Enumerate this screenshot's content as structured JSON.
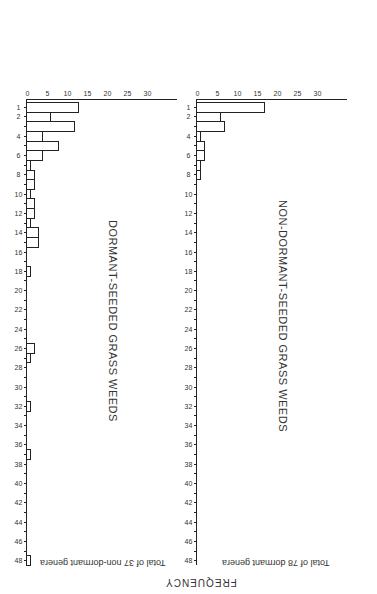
{
  "chart_data": [
    {
      "type": "bar",
      "title": "NON-DORMANT-SEEDED GRASS WEEDS",
      "ylabel": "Total of 37 non-dormant genera",
      "xlabel": "",
      "shared_ylabel": "FREQUENCY",
      "x_tick_labels": [
        "1",
        "2",
        "4",
        "6",
        "8",
        "10",
        "12",
        "14",
        "16",
        "18",
        "20",
        "22",
        "24",
        "26",
        "28",
        "30",
        "32",
        "34",
        "36",
        "38",
        "40",
        "42",
        "44",
        "46",
        "48"
      ],
      "y_tick_labels": [
        "0",
        "5",
        "10",
        "15",
        "20",
        "25",
        "30"
      ],
      "ylim": [
        0,
        35
      ],
      "xlim": [
        1,
        48
      ],
      "grid": false,
      "categories": [
        1,
        2,
        3,
        4,
        5,
        6,
        7,
        8
      ],
      "values": [
        17,
        6,
        7,
        1,
        2,
        2,
        1,
        1
      ]
    },
    {
      "type": "bar",
      "title": "DORMANT-SEEDED GRASS WEEDS",
      "ylabel": "Total of 78 dormant genera",
      "xlabel": "",
      "shared_ylabel": "FREQUENCY",
      "x_tick_labels": [
        "1",
        "2",
        "4",
        "6",
        "8",
        "10",
        "12",
        "14",
        "16",
        "18",
        "20",
        "22",
        "24",
        "26",
        "28",
        "30",
        "32",
        "34",
        "36",
        "38",
        "40",
        "42",
        "44",
        "46",
        "48"
      ],
      "y_tick_labels": [
        "0",
        "5",
        "10",
        "15",
        "20",
        "25",
        "30"
      ],
      "ylim": [
        0,
        35
      ],
      "xlim": [
        1,
        48
      ],
      "grid": false,
      "categories": [
        1,
        2,
        3,
        4,
        5,
        6,
        7,
        8,
        9,
        10,
        11,
        12,
        13,
        14,
        15,
        18,
        26,
        27,
        32,
        37,
        48
      ],
      "values": [
        13,
        6,
        12,
        4,
        8,
        4,
        1,
        2,
        2,
        1,
        2,
        2,
        1,
        3,
        3,
        1,
        2,
        1,
        1,
        1,
        1
      ]
    }
  ],
  "labels": {
    "title_top": "NON-DORMANT-SEEDED GRASS WEEDS",
    "title_bottom": "DORMANT-SEEDED GRASS WEEDS",
    "ylabel_top": "Total of 37 non-dormant genera",
    "ylabel_bottom": "Total of 78 dormant genera",
    "frequency": "FREQUENCY"
  }
}
